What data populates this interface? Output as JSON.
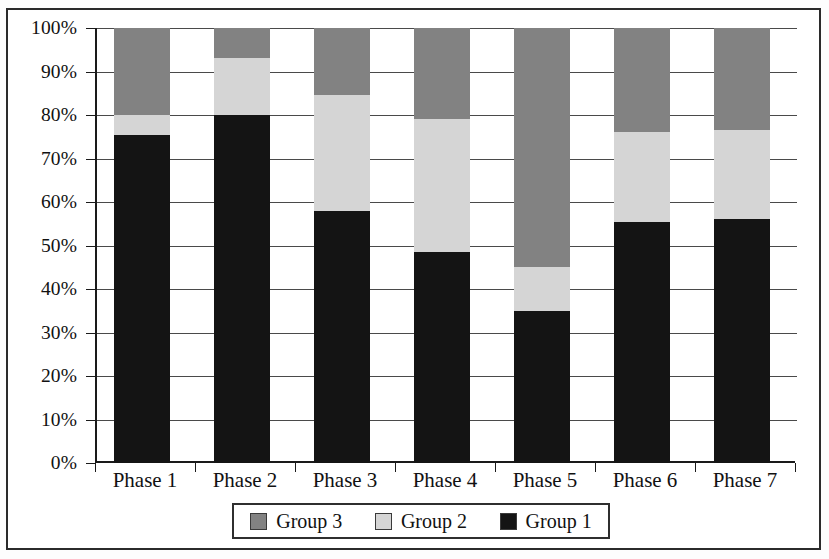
{
  "chart_data": {
    "type": "bar",
    "subtype": "100% stacked bar",
    "title": "",
    "subtitle": "",
    "xlabel": "",
    "ylabel": "",
    "categories": [
      "Phase 1",
      "Phase 2",
      "Phase 3",
      "Phase 4",
      "Phase 5",
      "Phase 6",
      "Phase 7"
    ],
    "series": [
      {
        "name": "Group 1",
        "color": "#141414",
        "values": [
          75.5,
          80.0,
          58.0,
          48.5,
          35.0,
          55.5,
          56.0
        ]
      },
      {
        "name": "Group 2",
        "color": "#d5d5d5",
        "values": [
          4.5,
          13.0,
          26.5,
          30.5,
          10.0,
          20.5,
          20.5
        ]
      },
      {
        "name": "Group 3",
        "color": "#828282",
        "values": [
          20.0,
          7.0,
          15.5,
          21.0,
          55.0,
          24.0,
          23.5
        ]
      }
    ],
    "stack_order_bottom_to_top": [
      "Group 1",
      "Group 2",
      "Group 3"
    ],
    "ylim": [
      0,
      100
    ],
    "ytick_labels": [
      "100%",
      "90%",
      "80%",
      "70%",
      "60%",
      "50%",
      "40%",
      "30%",
      "20%",
      "10%",
      "0%"
    ],
    "ytick_values": [
      100,
      90,
      80,
      70,
      60,
      50,
      40,
      30,
      20,
      10,
      0
    ],
    "grid": true,
    "grid_axis": "y",
    "legend_position": "bottom",
    "legend_entries": [
      {
        "label": "Group 3",
        "color": "#828282"
      },
      {
        "label": "Group 2",
        "color": "#d5d5d5"
      },
      {
        "label": "Group 1",
        "color": "#141414"
      }
    ]
  }
}
